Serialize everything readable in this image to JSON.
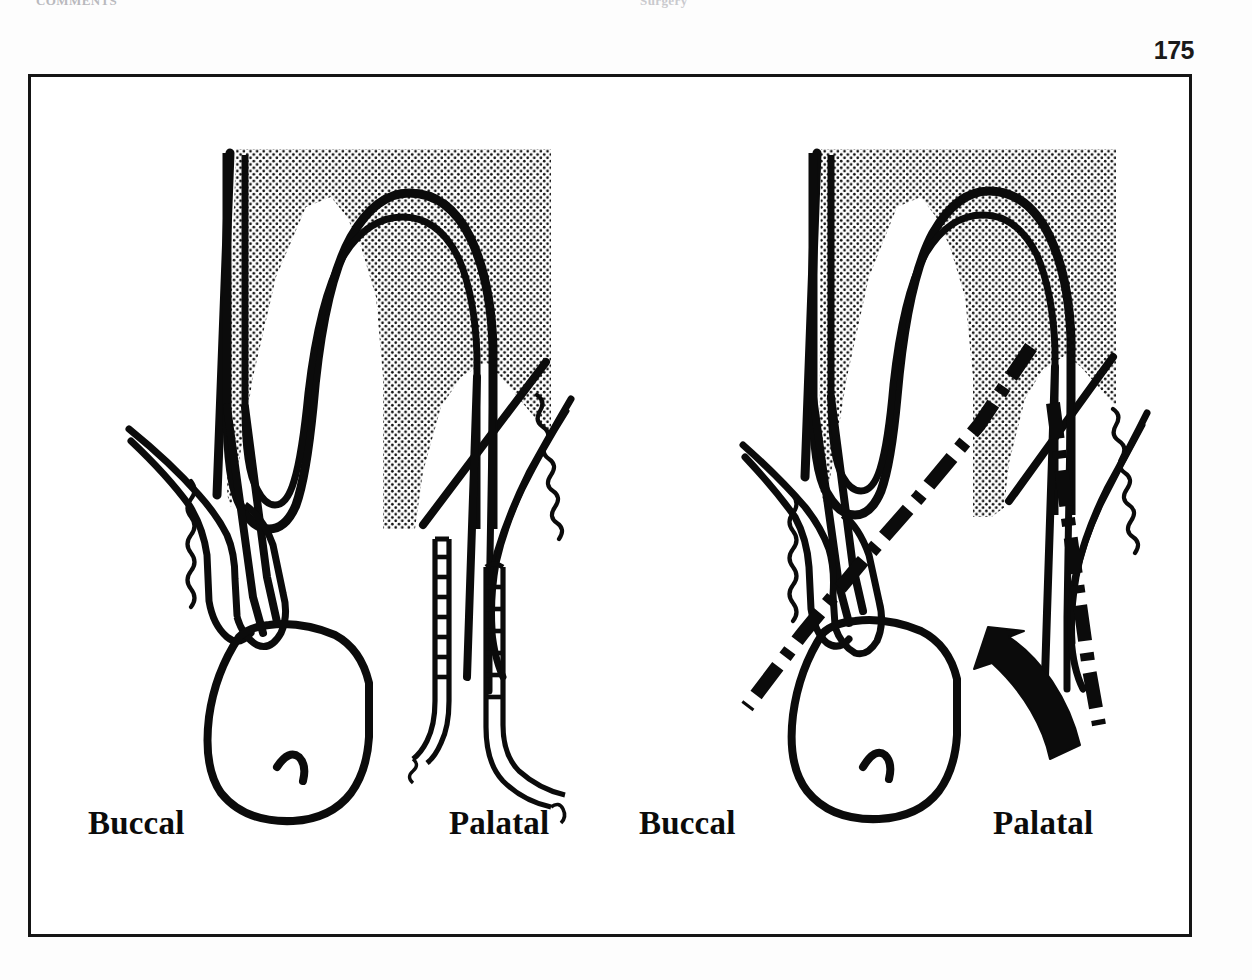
{
  "page": {
    "number": "175",
    "running_header_left": "COMMENTS",
    "running_header_right": "Surgery"
  },
  "figure": {
    "frame": {
      "border_color": "#151515",
      "background": "#ffffff"
    },
    "panels": [
      {
        "id": "panel-left",
        "name": "pre-operative-probing-panel",
        "labels": {
          "left": "Buccal",
          "right": "Palatal"
        },
        "elements": [
          "alveolar-bone-stipple",
          "tooth-root-outline",
          "periodontal-ligament-space",
          "gingival-tissue-outline",
          "mucosa-wavy-line",
          "tooth-crown-outline",
          "periodontal-probe-in-sulcus",
          "periodontal-probe-external"
        ]
      },
      {
        "id": "panel-right",
        "name": "incision-design-panel",
        "labels": {
          "left": "Buccal",
          "right": "Palatal"
        },
        "elements": [
          "alveolar-bone-stipple",
          "tooth-root-outline",
          "periodontal-ligament-space",
          "gingival-tissue-outline",
          "mucosa-wavy-line",
          "tooth-crown-outline",
          "buccal-incision-dash-dot-line",
          "palatal-incision-dash-dot-line",
          "flap-direction-arrow"
        ]
      }
    ]
  },
  "colors": {
    "ink": "#0b0b0b",
    "frame": "#151515",
    "stipple": "#111111",
    "paper": "#ffffff",
    "header_faint": "#b9b9bd"
  }
}
